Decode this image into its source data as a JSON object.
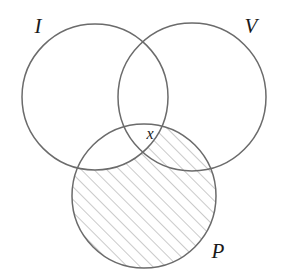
{
  "figure": {
    "kind": "venn-diagram",
    "sets_count": 3,
    "background_color": "#ffffff",
    "stroke_color": "#6b6b6b",
    "stroke_width": 1.5,
    "hatch_color": "#8a8a8a",
    "hatch_width": 0.9,
    "hatch_spacing": 9,
    "hatch_angle_deg": -45,
    "label_color": "#1a1a1a"
  },
  "circles": [
    {
      "id": "I",
      "name": "circle-i",
      "label": "I",
      "cx": 95,
      "cy": 97,
      "r": 73,
      "filled": false
    },
    {
      "id": "V",
      "name": "circle-v",
      "label": "V",
      "cx": 192,
      "cy": 97,
      "r": 74,
      "filled": false
    },
    {
      "id": "P",
      "name": "circle-p",
      "label": "P",
      "cx": 144,
      "cy": 196,
      "r": 72,
      "filled": true
    }
  ],
  "labels": {
    "set_i": {
      "text": "I",
      "x": 38,
      "y": 33
    },
    "set_v": {
      "text": "V",
      "x": 251,
      "y": 33
    },
    "set_p": {
      "text": "P",
      "x": 218,
      "y": 258
    },
    "region_x": {
      "text": "x",
      "x": 150,
      "y": 139
    }
  },
  "shaded_region": {
    "description": "P minus I",
    "includes": [
      "P"
    ],
    "excludes": [
      "I"
    ],
    "pattern": "diagonal-hatch"
  }
}
